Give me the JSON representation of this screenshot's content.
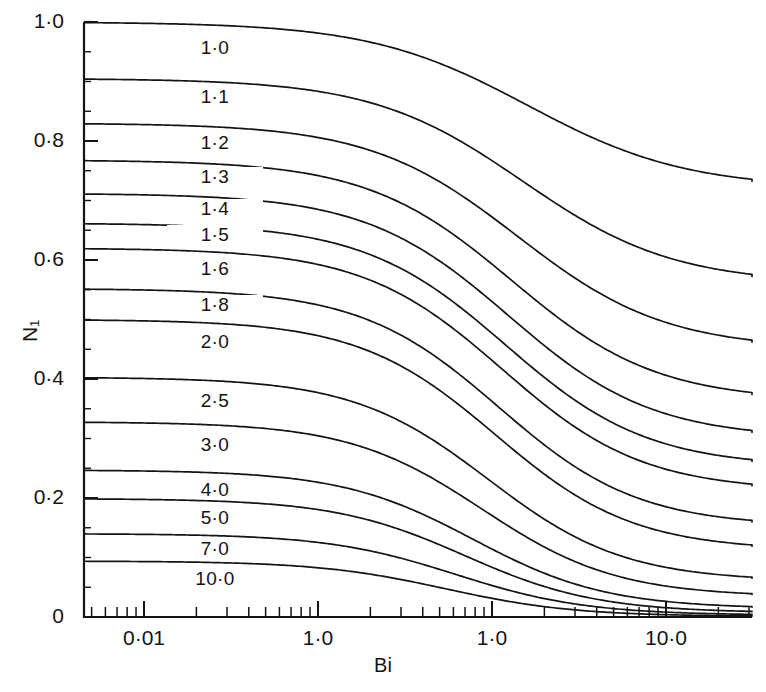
{
  "chart_data": {
    "type": "line",
    "title": "",
    "xlabel": "Bi",
    "ylabel": "N1",
    "ylabel_display": "N₁",
    "xscale": "log",
    "yscale": "linear",
    "xlim": [
      0.004,
      40
    ],
    "ylim": [
      0,
      1.0
    ],
    "grid": false,
    "legend": "inline-curve-labels",
    "x_tick_labels": [
      "0·01",
      "1·0",
      "1·0",
      "10·0"
    ],
    "x_tick_values": [
      0.01,
      0.1,
      1.0,
      10.0
    ],
    "y_tick_labels": [
      "0",
      "0·2",
      "0·4",
      "0·6",
      "0·8",
      "1·0"
    ],
    "y_tick_values": [
      0,
      0.2,
      0.4,
      0.6,
      0.8,
      1.0
    ],
    "y_minor_step": 0.05,
    "series": [
      {
        "name": "1·0",
        "label": "1·0",
        "y_left": 1.0,
        "y_right": 0.72,
        "x_mid": 1.6,
        "width": 1.05
      },
      {
        "name": "1·1",
        "label": "1·1",
        "y_left": 0.905,
        "y_right": 0.56,
        "x_mid": 1.5,
        "width": 1.0
      },
      {
        "name": "1·2",
        "label": "1·2",
        "y_left": 0.83,
        "y_right": 0.45,
        "x_mid": 1.4,
        "width": 0.98
      },
      {
        "name": "1·3",
        "label": "1·3",
        "y_left": 0.768,
        "y_right": 0.363,
        "x_mid": 1.3,
        "width": 0.96
      },
      {
        "name": "1·4",
        "label": "1·4",
        "y_left": 0.712,
        "y_right": 0.3,
        "x_mid": 1.25,
        "width": 0.95
      },
      {
        "name": "1·5",
        "label": "1·5",
        "y_left": 0.662,
        "y_right": 0.252,
        "x_mid": 1.2,
        "width": 0.94
      },
      {
        "name": "1·6",
        "label": "1·6",
        "y_left": 0.62,
        "y_right": 0.212,
        "x_mid": 1.15,
        "width": 0.93
      },
      {
        "name": "1·8",
        "label": "1·8",
        "y_left": 0.552,
        "y_right": 0.152,
        "x_mid": 1.1,
        "width": 0.92
      },
      {
        "name": "2·0",
        "label": "2·0",
        "y_left": 0.5,
        "y_right": 0.112,
        "x_mid": 1.05,
        "width": 0.91
      },
      {
        "name": "2·5",
        "label": "2·5",
        "y_left": 0.403,
        "y_right": 0.06,
        "x_mid": 0.95,
        "width": 0.9
      },
      {
        "name": "3·0",
        "label": "3·0",
        "y_left": 0.328,
        "y_right": 0.034,
        "x_mid": 0.88,
        "width": 0.89
      },
      {
        "name": "4·0",
        "label": "4·0",
        "y_left": 0.247,
        "y_right": 0.014,
        "x_mid": 0.78,
        "width": 0.88
      },
      {
        "name": "5·0",
        "label": "5·0",
        "y_left": 0.199,
        "y_right": 0.007,
        "x_mid": 0.7,
        "width": 0.87
      },
      {
        "name": "7·0",
        "label": "7·0",
        "y_left": 0.14,
        "y_right": 0.003,
        "x_mid": 0.62,
        "width": 0.86
      },
      {
        "name": "10·0",
        "label": "10·0",
        "y_left": 0.094,
        "y_right": 0.001,
        "x_mid": 0.54,
        "width": 0.85
      }
    ],
    "curve_label_y": [
      0.955,
      0.872,
      0.795,
      0.737,
      0.684,
      0.64,
      0.583,
      0.522,
      0.46,
      0.362,
      0.288,
      0.212,
      0.165,
      0.113,
      0.063
    ]
  },
  "axes": {
    "x_title": "Bi",
    "y_title": "N₁"
  },
  "style": {
    "line_color": "#141414",
    "axis_color": "#141414",
    "background": "#ffffff"
  }
}
